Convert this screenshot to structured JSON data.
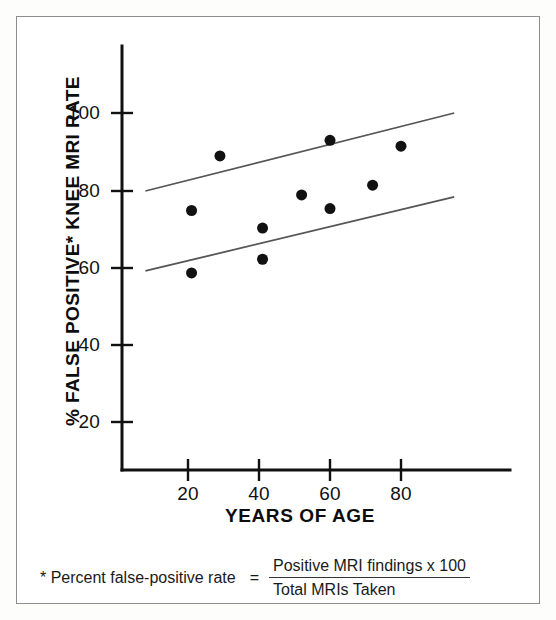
{
  "figure": {
    "background_color": "#ffffff",
    "border_color": "#8d8d8d",
    "ink_color": "#111111"
  },
  "axes": {
    "y_title": "% FALSE POSITIVE* KNEE MRI RATE",
    "x_title": "YEARS OF AGE",
    "y_ticks": [
      "20",
      "40",
      "60",
      "80",
      "100"
    ],
    "x_ticks": [
      "20",
      "40",
      "60",
      "80"
    ]
  },
  "footnote": {
    "prefix": "* Percent false-positive rate",
    "equals": "=",
    "numerator": "Positive MRI findings   x  100",
    "denominator": "Total MRIs Taken"
  },
  "chart_data": {
    "type": "scatter",
    "title": "",
    "xlabel": "YEARS OF AGE",
    "ylabel": "% FALSE POSITIVE* KNEE MRI RATE",
    "xlim": [
      0,
      100
    ],
    "ylim": [
      0,
      115
    ],
    "xticks": [
      20,
      40,
      60,
      80
    ],
    "yticks": [
      20,
      40,
      60,
      80,
      100
    ],
    "grid": false,
    "legend": "none",
    "marker": {
      "shape": "circle",
      "color": "#111111",
      "size_px": 11
    },
    "points": [
      {
        "x": 21,
        "y": 75
      },
      {
        "x": 21,
        "y": 59
      },
      {
        "x": 29,
        "y": 89
      },
      {
        "x": 41,
        "y": 70.5
      },
      {
        "x": 41,
        "y": 62.5
      },
      {
        "x": 52,
        "y": 79
      },
      {
        "x": 60,
        "y": 93
      },
      {
        "x": 60,
        "y": 75.5
      },
      {
        "x": 72,
        "y": 81.5
      },
      {
        "x": 80,
        "y": 91.5
      }
    ],
    "series": [
      {
        "name": "upper confidence band",
        "type": "line",
        "color": "#555555",
        "x": [
          8,
          95
        ],
        "values": [
          80,
          100
        ]
      },
      {
        "name": "lower confidence band",
        "type": "line",
        "color": "#555555",
        "x": [
          8,
          95
        ],
        "values": [
          59.5,
          78.5
        ]
      }
    ]
  }
}
